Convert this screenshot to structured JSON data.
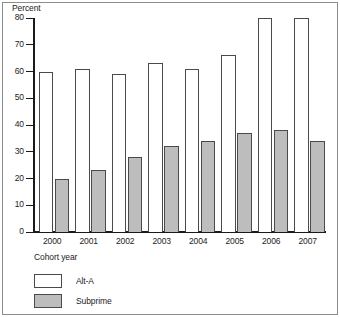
{
  "chart_data": {
    "type": "bar",
    "title": "",
    "ylabel": "Percent",
    "xlabel": "Cohort year",
    "categories": [
      "2000",
      "2001",
      "2002",
      "2003",
      "2004",
      "2005",
      "2006",
      "2007"
    ],
    "series": [
      {
        "name": "Alt-A",
        "values": [
          60,
          61,
          59,
          63,
          61,
          66,
          80,
          80
        ],
        "color": "#ffffff"
      },
      {
        "name": "Subprime",
        "values": [
          20,
          23,
          28,
          32,
          34,
          37,
          38,
          34
        ],
        "color": "#bdbdbd"
      }
    ],
    "ylim": [
      0,
      80
    ],
    "yticks": [
      0,
      10,
      20,
      30,
      40,
      50,
      60,
      70,
      80
    ],
    "ytick_labels": [
      "0",
      "10",
      "20",
      "30",
      "40",
      "50",
      "60",
      "70",
      "80"
    ],
    "grid": false,
    "legend_position": "bottom-left"
  },
  "legend": {
    "items": [
      {
        "label": "Alt-A",
        "swatch": "white-swatch"
      },
      {
        "label": "Subprime",
        "swatch": "gray-swatch"
      }
    ]
  }
}
